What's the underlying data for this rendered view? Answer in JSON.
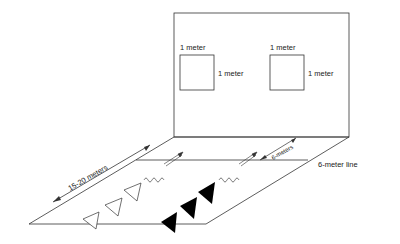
{
  "diagram": {
    "wall": {
      "targets": [
        {
          "top_label": "1 meter",
          "side_label": "1 meter"
        },
        {
          "top_label": "1 meter",
          "side_label": "1 meter"
        }
      ]
    },
    "floor": {
      "distance_label": "15-20 meters",
      "gap_label": "6-meters",
      "line_label": "6-meter line"
    },
    "players": {
      "white_triangles": 3,
      "black_triangles": 3
    },
    "colors": {
      "stroke": "#333333",
      "fill_dark": "#000000",
      "fill_light": "#ffffff"
    }
  }
}
